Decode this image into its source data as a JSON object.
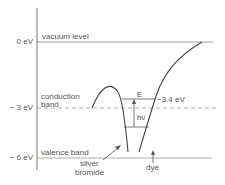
{
  "diagram": {
    "axis": {
      "ticks": [
        {
          "label": "0 eV",
          "value": 0
        },
        {
          "label": "− 3 eV",
          "value": -3
        },
        {
          "label": "− 6 eV",
          "value": -6
        }
      ]
    },
    "levels": {
      "vacuum": "vacuum level",
      "conduction_line1": "conduction",
      "conduction_line2": "band",
      "valence": "valence band"
    },
    "annotations": {
      "energy_gap": "E",
      "photon": "hν",
      "dye_level": "−3.4 eV"
    },
    "materials": {
      "silver_bromide_line1": "silver",
      "silver_bromide_line2": "bromide",
      "dye": "dye"
    },
    "colors": {
      "line": "#555555",
      "dashed": "#999999",
      "text": "#555555"
    }
  }
}
